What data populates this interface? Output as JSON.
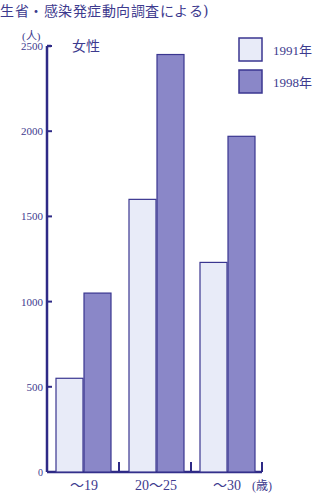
{
  "header": {
    "title_fragment": "生省・感染発症動向調査による)"
  },
  "chart_data": {
    "type": "bar",
    "title": "女性",
    "subtitle": "生省・感染発症動向調査による)",
    "ylabel": "(人)",
    "xlabel": "(歳)",
    "ylim": [
      0,
      2500
    ],
    "yticks": [
      0,
      500,
      1000,
      1500,
      2000,
      2500
    ],
    "grid": false,
    "legend_position": "top-right",
    "categories": [
      "〜19",
      "20〜25",
      "〜30"
    ],
    "series": [
      {
        "name": "1991年",
        "values": [
          550,
          1600,
          1230
        ],
        "color": "#e8ebf8"
      },
      {
        "name": "1998年",
        "values": [
          1050,
          2450,
          1970
        ],
        "color": "#8a87c8"
      }
    ]
  },
  "colors": {
    "axis": "#2e2a86",
    "bar_border": "#3a3690"
  }
}
